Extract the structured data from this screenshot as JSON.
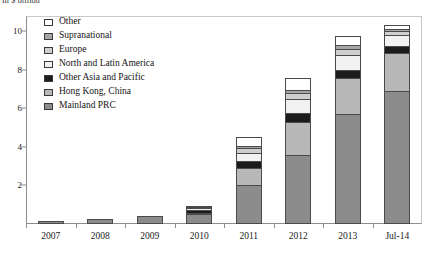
{
  "caption": "In $ billion",
  "chart_data": {
    "type": "bar",
    "subtype": "stacked-vertical",
    "title": "",
    "subtitle": "",
    "xlabel": "",
    "ylabel": "",
    "unit": "In $ billion",
    "ylim": [
      0,
      10.8
    ],
    "yticks": [
      2,
      4,
      6,
      8,
      10
    ],
    "grid": false,
    "legend_position": "top-left",
    "categories": [
      "2007",
      "2008",
      "2009",
      "2010",
      "2011",
      "2012",
      "2013",
      "Jul-14"
    ],
    "series": [
      {
        "name": "Mainland PRC",
        "color": "#8c8c8c",
        "values": [
          0.15,
          0.25,
          0.4,
          0.5,
          2.0,
          3.6,
          5.7,
          6.9
        ]
      },
      {
        "name": "Hong Kong, China",
        "color": "#b8b8b8",
        "values": [
          0.0,
          0.0,
          0.0,
          0.1,
          0.9,
          1.7,
          1.9,
          2.0
        ]
      },
      {
        "name": "Other Asia and Pacific",
        "color": "#1c1c1c",
        "values": [
          0.0,
          0.0,
          0.0,
          0.15,
          0.35,
          0.45,
          0.4,
          0.35
        ]
      },
      {
        "name": "North and Latin America",
        "color": "#f2f2f2",
        "values": [
          0.0,
          0.0,
          0.0,
          0.1,
          0.45,
          0.75,
          0.75,
          0.55
        ]
      },
      {
        "name": "Europe",
        "color": "#cfcfcf",
        "values": [
          0.0,
          0.0,
          0.0,
          0.05,
          0.25,
          0.3,
          0.35,
          0.2
        ]
      },
      {
        "name": "Supranational",
        "color": "#a6a6a6",
        "values": [
          0.0,
          0.0,
          0.0,
          0.0,
          0.1,
          0.15,
          0.2,
          0.15
        ]
      },
      {
        "name": "Other",
        "color": "#ffffff",
        "values": [
          0.0,
          0.0,
          0.0,
          0.05,
          0.45,
          0.65,
          0.45,
          0.2
        ]
      }
    ],
    "totals": [
      0.15,
      0.25,
      0.4,
      0.95,
      4.5,
      7.6,
      9.75,
      10.35
    ]
  },
  "legend": {
    "items": [
      {
        "label": "Other",
        "swatch": "other"
      },
      {
        "label": "Supranational",
        "swatch": "supra"
      },
      {
        "label": "Europe",
        "swatch": "europe"
      },
      {
        "label": "North and Latin America",
        "swatch": "nla"
      },
      {
        "label": "Other Asia and Pacific",
        "swatch": "oap"
      },
      {
        "label": "Hong Kong, China",
        "swatch": "hk"
      },
      {
        "label": "Mainland PRC",
        "swatch": "mainland"
      }
    ]
  }
}
